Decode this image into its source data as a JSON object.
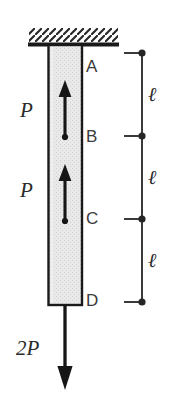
{
  "figure": {
    "background_color": "#ffffff",
    "line_color": "#2b2b2b",
    "bar_fill_color": "#e8e8e8",
    "bar_outline_color": "#1a1a1a",
    "support": {
      "type": "fixed-support-hatched",
      "hatch_direction": "forward-slash"
    },
    "bar": {
      "left": 48,
      "right": 82,
      "top": 45,
      "bottom": 305
    },
    "node_labels": [
      {
        "text": "A",
        "x": 86,
        "y": 58
      },
      {
        "text": "B",
        "x": 86,
        "y": 128
      },
      {
        "text": "C",
        "x": 86,
        "y": 210
      },
      {
        "text": "D",
        "x": 86,
        "y": 292
      }
    ],
    "internal_forces": [
      {
        "label": "P",
        "x": 20,
        "y": 100,
        "direction": "up",
        "applied_at": "B"
      },
      {
        "label": "P",
        "x": 20,
        "y": 180,
        "direction": "up",
        "applied_at": "C"
      }
    ],
    "end_load": {
      "label": "2P",
      "x": 16,
      "y": 338,
      "direction": "down",
      "applied_at": "D"
    },
    "dimension_chain": {
      "x": 142,
      "ticks_y": [
        53,
        136,
        219,
        302
      ],
      "segments": [
        {
          "label": "ℓ",
          "label_x": 148,
          "label_y": 84
        },
        {
          "label": "ℓ",
          "label_x": 148,
          "label_y": 167
        },
        {
          "label": "ℓ",
          "label_x": 148,
          "label_y": 250
        }
      ]
    }
  }
}
